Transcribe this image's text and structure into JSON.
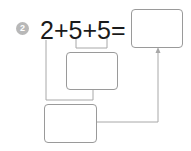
{
  "problem": {
    "number": "2",
    "equation": "2+5+5=",
    "terms": [
      "2",
      "5",
      "5"
    ],
    "operators": [
      "+",
      "+",
      "="
    ]
  },
  "boxes": {
    "answer": "",
    "intermediate": "",
    "final_sum": ""
  },
  "colors": {
    "line": "#a0a0a0",
    "badge": "#b8b8b8",
    "text": "#1a1a1a"
  }
}
